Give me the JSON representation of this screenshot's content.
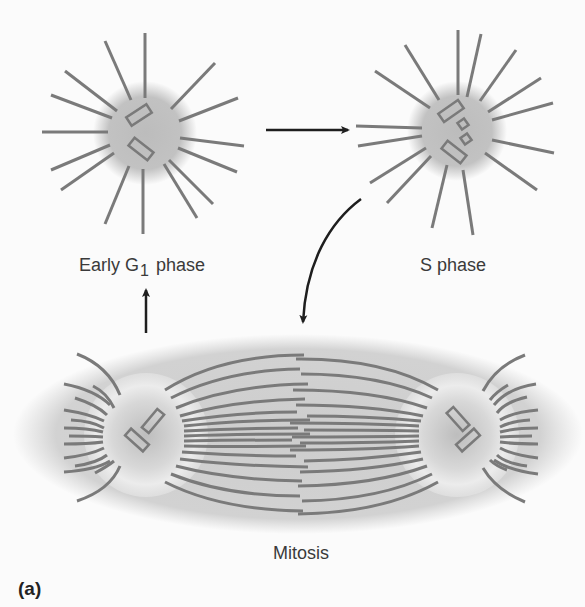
{
  "figure": {
    "panel_label": "(a)",
    "stages": {
      "early_g1": {
        "label_prefix": "Early G",
        "label_subscript": "1",
        "label_suffix": " phase"
      },
      "s_phase": {
        "label": "S phase"
      },
      "mitosis": {
        "label": "Mitosis"
      }
    },
    "arrows": [
      {
        "from": "Early G1 phase",
        "to": "S phase",
        "shape": "straight"
      },
      {
        "from": "S phase",
        "to": "Mitosis",
        "shape": "curved"
      },
      {
        "from": "Mitosis",
        "to": "Early G1 phase",
        "shape": "straight"
      }
    ],
    "colors": {
      "background": "#fbfbfb",
      "microtubule": "#7a7a7a",
      "centrosome_halo": "#bdbdbd",
      "spindle_cell": "#cfcfcf",
      "arrow": "#1e1e1e",
      "text": "#3a3a3a"
    }
  }
}
